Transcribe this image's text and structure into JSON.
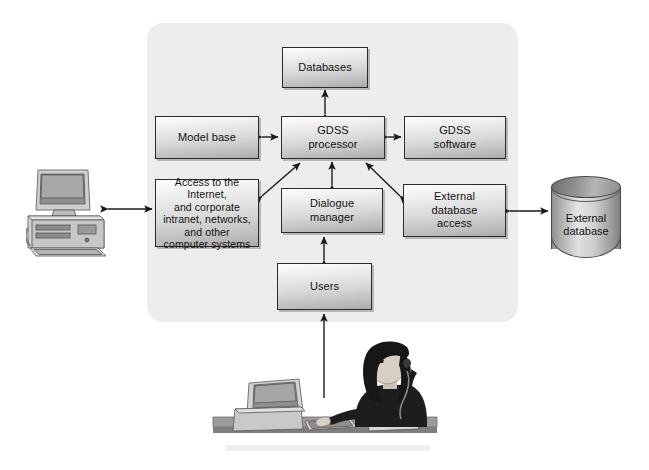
{
  "figure": {
    "background_color": "#ffffff",
    "panel_color": "#eceded",
    "box_border_color": "#2b2b2b",
    "arrow_color": "#1a1a1a"
  },
  "panel": {
    "label": "GDSS boundary panel"
  },
  "boxes": [
    {
      "id": "databases",
      "label": "Databases"
    },
    {
      "id": "model_base",
      "label": "Model base"
    },
    {
      "id": "gdss_processor",
      "label_line1": "GDSS",
      "label_line2": "processor"
    },
    {
      "id": "gdss_software",
      "label_line1": "GDSS",
      "label_line2": "software"
    },
    {
      "id": "access_network",
      "label_line1": "Access to the Internet,",
      "label_line2": "and corporate",
      "label_line3": "intranet, networks,",
      "label_line4": "and other",
      "label_line5": "computer systems"
    },
    {
      "id": "dialogue_manager",
      "label_line1": "Dialogue",
      "label_line2": "manager"
    },
    {
      "id": "external_db_access",
      "label_line1": "External",
      "label_line2": "database",
      "label_line3": "access"
    },
    {
      "id": "users",
      "label": "Users"
    }
  ],
  "cylinder": {
    "id": "external_database",
    "label_line1": "External",
    "label_line2": "database"
  },
  "illustrations": [
    {
      "id": "workstation",
      "label": "desktop computer workstation"
    },
    {
      "id": "user_at_desk",
      "label": "person seated at desk using computer and telephone"
    }
  ],
  "connectors": [
    {
      "from": "gdss_processor",
      "to": "databases",
      "style": "double-arrow",
      "orientation": "vertical"
    },
    {
      "from": "model_base",
      "to": "gdss_processor",
      "style": "double-arrow",
      "orientation": "horizontal"
    },
    {
      "from": "gdss_processor",
      "to": "gdss_software",
      "style": "double-arrow",
      "orientation": "horizontal"
    },
    {
      "from": "access_network",
      "to": "gdss_processor",
      "style": "double-arrow",
      "orientation": "diagonal"
    },
    {
      "from": "dialogue_manager",
      "to": "gdss_processor",
      "style": "double-arrow",
      "orientation": "vertical"
    },
    {
      "from": "external_db_access",
      "to": "gdss_processor",
      "style": "double-arrow",
      "orientation": "diagonal"
    },
    {
      "from": "users",
      "to": "dialogue_manager",
      "style": "double-arrow",
      "orientation": "vertical"
    },
    {
      "from": "workstation",
      "to": "access_network",
      "style": "double-arrow",
      "orientation": "horizontal"
    },
    {
      "from": "external_db_access",
      "to": "external_database",
      "style": "double-arrow",
      "orientation": "horizontal"
    },
    {
      "from": "user_at_desk",
      "to": "users",
      "style": "single-arrow-up",
      "orientation": "vertical"
    }
  ]
}
